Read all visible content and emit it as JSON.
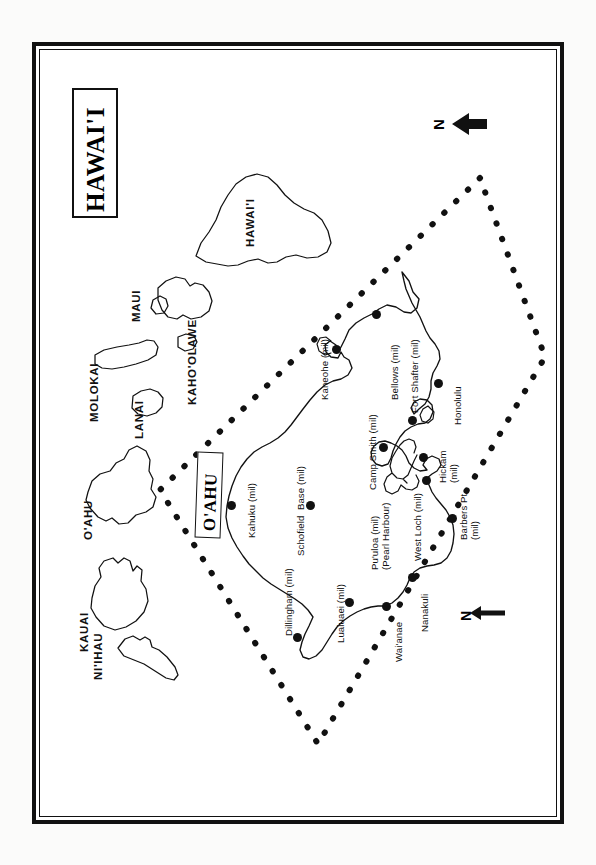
{
  "map": {
    "title": "HAWAI'I",
    "inset_title": "O'AHU",
    "north_label_top": "N",
    "north_label_bottom": "N",
    "islands": [
      {
        "name": "KAUAI",
        "label": "KAUAI"
      },
      {
        "name": "NI'IHAU",
        "label": "NI'IHAU"
      },
      {
        "name": "O'AHU",
        "label": "O'AHU"
      },
      {
        "name": "MOLOKAI",
        "label": "MOLOKAI"
      },
      {
        "name": "LANAI",
        "label": "LANAI"
      },
      {
        "name": "MAUI",
        "label": "MAUI"
      },
      {
        "name": "KAHO'OLAWE",
        "label": "KAHO'OLAWE"
      },
      {
        "name": "HAWAI'I",
        "label": "HAWAI'I"
      }
    ],
    "places": [
      {
        "id": "kahuku",
        "label": "Kahuku (mil)",
        "line2": ""
      },
      {
        "id": "schofield",
        "label": "Schofield  Base (mil)",
        "line2": ""
      },
      {
        "id": "kaneohe",
        "label": "Kaneohe (mil)",
        "line2": ""
      },
      {
        "id": "bellows",
        "label": "Bellows (mil)",
        "line2": ""
      },
      {
        "id": "fort-shafter",
        "label": "Fort Shafter (mil)",
        "line2": ""
      },
      {
        "id": "honolulu",
        "label": "Honolulu",
        "line2": ""
      },
      {
        "id": "camp-smith",
        "label": "Camp Smith (mil)",
        "line2": ""
      },
      {
        "id": "hickam",
        "label": "Hickam",
        "line2": "(mil)"
      },
      {
        "id": "puuloa",
        "label": "Pu'uloa (mil)",
        "line2": "(Pearl Harbour)"
      },
      {
        "id": "west-loch",
        "label": "West Loch (mil)",
        "line2": ""
      },
      {
        "id": "barbers-pt",
        "label": "Barbers Pt.",
        "line2": "(mil)"
      },
      {
        "id": "nanakuli",
        "label": "Nanakuli",
        "line2": ""
      },
      {
        "id": "waianae",
        "label": "Wai'anae",
        "line2": ""
      },
      {
        "id": "lualuaei",
        "label": "Lualuaei (mil)",
        "line2": ""
      },
      {
        "id": "dillingham",
        "label": "Dillingham (mil)",
        "line2": ""
      }
    ],
    "colors": {
      "ink": "#111111",
      "paper": "#ffffff",
      "page": "#fbfbfa"
    }
  }
}
